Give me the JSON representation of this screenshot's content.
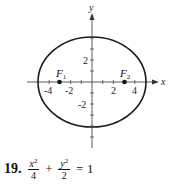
{
  "figure": {
    "axes": {
      "x_label": "x",
      "y_label": "y",
      "x_ticks": [
        {
          "value": -4,
          "label": "-4"
        },
        {
          "value": -2,
          "label": "-2"
        },
        {
          "value": 2,
          "label": "2"
        },
        {
          "value": 4,
          "label": "4"
        }
      ],
      "y_ticks": [
        {
          "value": 2,
          "label": "2"
        },
        {
          "value": -2,
          "label": "-2"
        }
      ]
    },
    "foci": [
      {
        "name": "F",
        "subscript": "1",
        "x": -3
      },
      {
        "name": "F",
        "subscript": "2",
        "x": 3
      }
    ],
    "ellipse": {
      "a": 5,
      "b": 4.2,
      "color": "#1a1a1a"
    }
  },
  "problem": {
    "number": "19.",
    "term1": {
      "numerator_var": "x",
      "numerator_exp": "2",
      "denominator": "4"
    },
    "plus": "+",
    "term2": {
      "numerator_var": "y",
      "numerator_exp": "2",
      "denominator": "2"
    },
    "equals": "=",
    "rhs": "1"
  }
}
